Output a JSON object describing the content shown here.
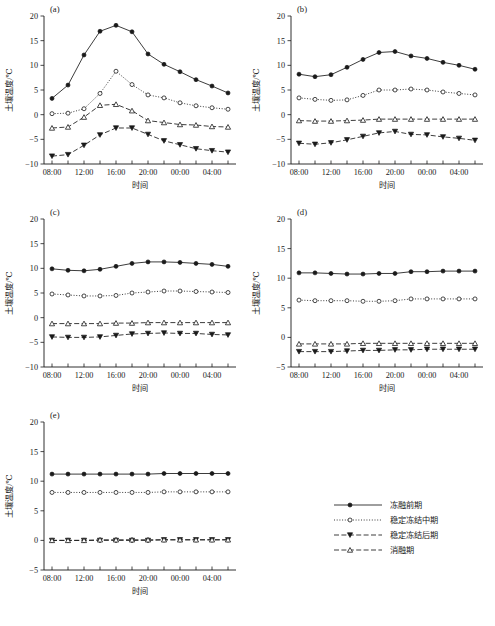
{
  "figure": {
    "axis_labels": {
      "x": "时间",
      "y": "土壤温度/℃"
    },
    "panel_labels": [
      "(a)",
      "(b)",
      "(c)",
      "(d)",
      "(e)"
    ],
    "x_tick_labels": [
      "08:00",
      "12:00",
      "16:00",
      "20:00",
      "00:00",
      "04:00"
    ],
    "legend": {
      "items": [
        {
          "label": "冻融前期",
          "marker": "filled-circle",
          "line": "solid"
        },
        {
          "label": "稳定冻结中期",
          "marker": "open-circle",
          "line": "dotted"
        },
        {
          "label": "稳定冻结后期",
          "marker": "filled-down-triangle",
          "line": "dashed"
        },
        {
          "label": "消融期",
          "marker": "open-up-triangle",
          "line": "dash-dot"
        }
      ]
    },
    "colors": {
      "ink": "#1a1a1a",
      "background": "#ffffff"
    }
  },
  "chart_data": [
    {
      "type": "line",
      "panel": "(a)",
      "title": "",
      "xlabel": "时间",
      "ylabel": "土壤温度/℃",
      "ylim": [
        -10,
        20
      ],
      "yticks": [
        -10,
        -5,
        0,
        5,
        10,
        15,
        20
      ],
      "x": [
        "08:00",
        "10:00",
        "12:00",
        "14:00",
        "16:00",
        "18:00",
        "20:00",
        "22:00",
        "00:00",
        "02:00",
        "04:00",
        "06:00"
      ],
      "grid": false,
      "legend_position": "external-right",
      "series": [
        {
          "name": "冻融前期",
          "values": [
            3.3,
            6.0,
            12.1,
            16.9,
            18.1,
            16.8,
            12.3,
            10.2,
            8.7,
            7.1,
            5.8,
            4.4
          ]
        },
        {
          "name": "稳定冻结中期",
          "values": [
            0.2,
            0.3,
            1.2,
            4.3,
            8.8,
            6.1,
            4.0,
            3.4,
            2.4,
            1.8,
            1.4,
            1.1
          ]
        },
        {
          "name": "稳定冻结后期",
          "values": [
            -8.4,
            -8.1,
            -6.2,
            -4.1,
            -2.7,
            -2.7,
            -4.0,
            -5.3,
            -6.1,
            -6.9,
            -7.3,
            -7.6
          ]
        },
        {
          "name": "消融期",
          "values": [
            -2.7,
            -2.5,
            -0.5,
            1.9,
            2.1,
            0.8,
            -1.2,
            -1.6,
            -2.0,
            -2.1,
            -2.4,
            -2.5
          ]
        }
      ]
    },
    {
      "type": "line",
      "panel": "(b)",
      "title": "",
      "xlabel": "时间",
      "ylabel": "土壤温度/℃",
      "ylim": [
        -10,
        20
      ],
      "yticks": [
        -10,
        -5,
        0,
        5,
        10,
        15,
        20
      ],
      "x": [
        "08:00",
        "10:00",
        "12:00",
        "14:00",
        "16:00",
        "18:00",
        "20:00",
        "22:00",
        "00:00",
        "02:00",
        "04:00",
        "06:00"
      ],
      "grid": false,
      "legend_position": "external-right",
      "series": [
        {
          "name": "冻融前期",
          "values": [
            8.2,
            7.7,
            8.1,
            9.6,
            11.2,
            12.6,
            12.8,
            11.9,
            11.4,
            10.6,
            10.0,
            9.2
          ]
        },
        {
          "name": "稳定冻结中期",
          "values": [
            3.4,
            3.1,
            2.9,
            3.0,
            3.9,
            5.0,
            5.0,
            5.2,
            5.0,
            4.6,
            4.3,
            4.0
          ]
        },
        {
          "name": "稳定冻结后期",
          "values": [
            -5.8,
            -6.0,
            -5.7,
            -5.1,
            -4.4,
            -3.7,
            -3.4,
            -4.0,
            -4.1,
            -4.5,
            -4.8,
            -5.2
          ]
        },
        {
          "name": "消融期",
          "values": [
            -1.2,
            -1.3,
            -1.3,
            -1.2,
            -1.1,
            -0.9,
            -0.9,
            -0.9,
            -0.9,
            -0.9,
            -0.9,
            -0.9
          ]
        }
      ]
    },
    {
      "type": "line",
      "panel": "(c)",
      "title": "",
      "xlabel": "时间",
      "ylabel": "土壤温度/℃",
      "ylim": [
        -10,
        20
      ],
      "yticks": [
        -10,
        -5,
        0,
        5,
        10,
        15,
        20
      ],
      "x": [
        "08:00",
        "10:00",
        "12:00",
        "14:00",
        "16:00",
        "18:00",
        "20:00",
        "22:00",
        "00:00",
        "02:00",
        "04:00",
        "06:00"
      ],
      "grid": false,
      "legend_position": "external-right",
      "series": [
        {
          "name": "冻融前期",
          "values": [
            9.9,
            9.6,
            9.5,
            9.8,
            10.4,
            11.0,
            11.3,
            11.3,
            11.2,
            11.0,
            10.8,
            10.4
          ]
        },
        {
          "name": "稳定冻结中期",
          "values": [
            4.8,
            4.6,
            4.4,
            4.4,
            4.5,
            5.0,
            5.2,
            5.4,
            5.4,
            5.3,
            5.2,
            5.1
          ]
        },
        {
          "name": "稳定冻结后期",
          "values": [
            -3.9,
            -4.0,
            -4.0,
            -3.9,
            -3.6,
            -3.3,
            -3.2,
            -3.1,
            -3.2,
            -3.2,
            -3.4,
            -3.5
          ]
        },
        {
          "name": "消融期",
          "values": [
            -1.2,
            -1.2,
            -1.2,
            -1.2,
            -1.1,
            -1.1,
            -1.0,
            -1.0,
            -1.0,
            -1.0,
            -1.0,
            -1.0
          ]
        }
      ]
    },
    {
      "type": "line",
      "panel": "(d)",
      "title": "",
      "xlabel": "时间",
      "ylabel": "土壤温度/℃",
      "ylim": [
        -5,
        20
      ],
      "yticks": [
        -5,
        0,
        5,
        10,
        15,
        20
      ],
      "x": [
        "08:00",
        "10:00",
        "12:00",
        "14:00",
        "16:00",
        "18:00",
        "20:00",
        "22:00",
        "00:00",
        "02:00",
        "04:00",
        "06:00"
      ],
      "grid": false,
      "legend_position": "external-right",
      "series": [
        {
          "name": "冻融前期",
          "values": [
            10.9,
            10.9,
            10.8,
            10.7,
            10.7,
            10.8,
            10.8,
            11.1,
            11.1,
            11.2,
            11.2,
            11.2
          ]
        },
        {
          "name": "稳定冻结中期",
          "values": [
            6.3,
            6.2,
            6.2,
            6.2,
            6.1,
            6.1,
            6.2,
            6.5,
            6.5,
            6.5,
            6.5,
            6.5
          ]
        },
        {
          "name": "稳定冻结后期",
          "values": [
            -2.4,
            -2.4,
            -2.4,
            -2.3,
            -2.2,
            -2.2,
            -2.1,
            -2.1,
            -2.0,
            -2.0,
            -2.0,
            -2.0
          ]
        },
        {
          "name": "消融期",
          "values": [
            -1.1,
            -1.1,
            -1.1,
            -1.1,
            -1.0,
            -1.0,
            -1.0,
            -1.0,
            -1.0,
            -1.0,
            -1.0,
            -1.0
          ]
        }
      ]
    },
    {
      "type": "line",
      "panel": "(e)",
      "title": "",
      "xlabel": "时间",
      "ylabel": "土壤温度/℃",
      "ylim": [
        -5,
        20
      ],
      "yticks": [
        -5,
        0,
        5,
        10,
        15,
        20
      ],
      "x": [
        "08:00",
        "10:00",
        "12:00",
        "14:00",
        "16:00",
        "18:00",
        "20:00",
        "22:00",
        "00:00",
        "02:00",
        "04:00",
        "06:00"
      ],
      "grid": false,
      "legend_position": "external-right",
      "series": [
        {
          "name": "冻融前期",
          "values": [
            11.2,
            11.2,
            11.2,
            11.2,
            11.2,
            11.2,
            11.2,
            11.3,
            11.3,
            11.3,
            11.3,
            11.3
          ]
        },
        {
          "name": "稳定冻结中期",
          "values": [
            8.1,
            8.1,
            8.1,
            8.1,
            8.1,
            8.1,
            8.1,
            8.2,
            8.2,
            8.2,
            8.2,
            8.2
          ]
        },
        {
          "name": "稳定冻结后期",
          "values": [
            0.0,
            0.0,
            0.0,
            0.0,
            0.0,
            0.0,
            0.0,
            0.1,
            0.1,
            0.1,
            0.1,
            0.1
          ]
        },
        {
          "name": "消融期",
          "values": [
            0.0,
            0.0,
            0.0,
            0.1,
            0.1,
            0.1,
            0.1,
            0.1,
            0.1,
            0.1,
            0.1,
            0.1
          ]
        }
      ]
    }
  ]
}
